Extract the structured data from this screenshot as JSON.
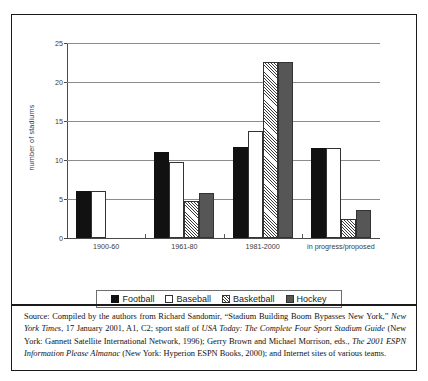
{
  "figure": {
    "ylabel": "number of stadiums",
    "source_prefix": "Source: Compiled by the authors from Richard Sandomir, “Stadium Building Boom Bypasses New York,” ",
    "source_it1": "New York Times",
    "source_mid1": ", 17 January 2001, A1, C2; sport staff of ",
    "source_it2": "USA Today: The Complete Four Sport Stadium Guide",
    "source_mid2": " (New York: Gannett Satellite International Network, 1996); Gerry Brown and Michael Morrison, eds., ",
    "source_it3": "The 2001 ESPN Information Please Almanac",
    "source_end": " (New York: Hyperion ESPN Books, 2000); and Internet sites of various teams."
  },
  "legend": {
    "position": "bottom",
    "items": [
      {
        "label": "Football",
        "key": "football",
        "color": "#111111"
      },
      {
        "label": "Baseball",
        "key": "baseball",
        "color": "#ffffff"
      },
      {
        "label": "Basketball",
        "key": "basketball",
        "color": "#ffffff"
      },
      {
        "label": "Hockey",
        "key": "hockey",
        "color": "#565656"
      }
    ]
  },
  "chart_data": {
    "type": "bar",
    "title": "",
    "xlabel": "",
    "ylabel": "number of stadiums",
    "categories": [
      "1900-60",
      "1961-80",
      "1981-2000",
      "in progress/proposed"
    ],
    "series": [
      {
        "name": "Football",
        "values": [
          6,
          11,
          11.7,
          11.5
        ]
      },
      {
        "name": "Baseball",
        "values": [
          6,
          9.8,
          13.7,
          11.5
        ]
      },
      {
        "name": "Basketball",
        "values": [
          0,
          4.8,
          22.6,
          2.5
        ]
      },
      {
        "name": "Hockey",
        "values": [
          0,
          5.8,
          22.6,
          3.6
        ]
      }
    ],
    "ylim": [
      0,
      25
    ],
    "yticks": [
      0,
      5,
      10,
      15,
      20,
      25
    ],
    "ytick_labels": [
      "0",
      "5",
      "10",
      "15",
      "20",
      "25"
    ],
    "grid": true,
    "legend_position": "bottom"
  }
}
